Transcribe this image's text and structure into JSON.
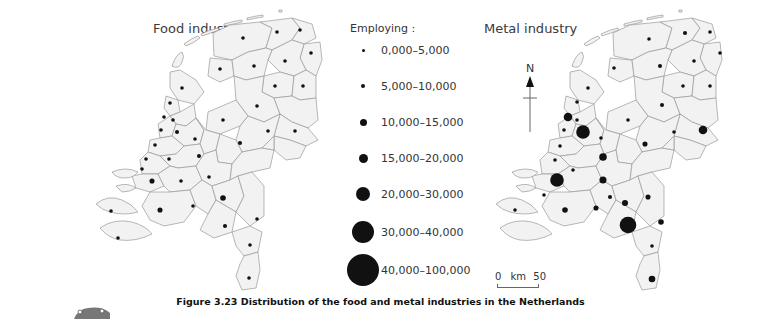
{
  "titles": {
    "food": "Food industry",
    "metal": "Metal industry"
  },
  "legend": {
    "title": "Employing :",
    "items": [
      {
        "label": "0,000–5,000",
        "size": 3
      },
      {
        "label": "5,000–10,000",
        "size": 4.5
      },
      {
        "label": "10,000–15,000",
        "size": 7
      },
      {
        "label": "15,000–20,000",
        "size": 9
      },
      {
        "label": "20,000–30,000",
        "size": 14
      },
      {
        "label": "30,000–40,000",
        "size": 22
      },
      {
        "label": "40,000–100,000",
        "size": 32
      }
    ]
  },
  "north_label": "N",
  "scale": {
    "start": "0",
    "unit": "km",
    "end": "50"
  },
  "caption": "Figure 3.23  Distribution of the food and metal industries in the Netherlands",
  "colors": {
    "land": "#f2f2f2",
    "border": "#9a9a9a",
    "symbol": "#111111"
  },
  "maps": {
    "food": {
      "dots": [
        [
          243,
          38,
          3
        ],
        [
          277,
          32,
          3
        ],
        [
          300,
          30,
          3
        ],
        [
          311,
          53,
          3
        ],
        [
          220,
          69,
          3
        ],
        [
          254,
          66,
          3
        ],
        [
          285,
          61,
          3
        ],
        [
          275,
          86,
          3
        ],
        [
          303,
          86,
          3
        ],
        [
          182,
          88,
          3
        ],
        [
          170,
          103,
          3
        ],
        [
          257,
          106,
          3
        ],
        [
          223,
          120,
          3
        ],
        [
          295,
          131,
          3
        ],
        [
          268,
          131,
          3
        ],
        [
          164,
          117,
          3
        ],
        [
          173,
          120,
          3
        ],
        [
          161,
          130,
          3
        ],
        [
          177,
          132,
          3.5
        ],
        [
          240,
          143,
          3.5
        ],
        [
          195,
          139,
          3
        ],
        [
          155,
          145,
          3
        ],
        [
          146,
          159,
          3
        ],
        [
          169,
          159,
          3
        ],
        [
          199,
          156,
          3.5
        ],
        [
          142,
          169,
          3
        ],
        [
          152,
          181,
          4.5
        ],
        [
          181,
          181,
          3
        ],
        [
          209,
          177,
          3
        ],
        [
          223,
          198,
          5
        ],
        [
          160,
          210,
          4.5
        ],
        [
          193,
          206,
          3
        ],
        [
          225,
          226,
          3.5
        ],
        [
          257,
          219,
          3
        ],
        [
          250,
          245,
          3
        ],
        [
          249,
          278,
          3
        ],
        [
          111,
          211,
          3
        ],
        [
          118,
          238,
          3
        ]
      ]
    },
    "metal": {
      "dots": [
        [
          649,
          39,
          3
        ],
        [
          685,
          33,
          3.5
        ],
        [
          710,
          32,
          3
        ],
        [
          720,
          53,
          3
        ],
        [
          614,
          68,
          3
        ],
        [
          660,
          66,
          3.5
        ],
        [
          694,
          61,
          3
        ],
        [
          683,
          86,
          3
        ],
        [
          710,
          86,
          3
        ],
        [
          588,
          88,
          3
        ],
        [
          577,
          102,
          3
        ],
        [
          662,
          105,
          3.5
        ],
        [
          628,
          120,
          3
        ],
        [
          703,
          130,
          8
        ],
        [
          674,
          132,
          3
        ],
        [
          568,
          117,
          8
        ],
        [
          577,
          120,
          3
        ],
        [
          564,
          130,
          3
        ],
        [
          583,
          132,
          13
        ],
        [
          645,
          144,
          4.5
        ],
        [
          601,
          138,
          3
        ],
        [
          560,
          146,
          3
        ],
        [
          603,
          157,
          7
        ],
        [
          555,
          160,
          3
        ],
        [
          573,
          170,
          3
        ],
        [
          603,
          180,
          6.5
        ],
        [
          557,
          180,
          13
        ],
        [
          544,
          195,
          3
        ],
        [
          610,
          197,
          3.5
        ],
        [
          648,
          197,
          4.5
        ],
        [
          625,
          203,
          5.5
        ],
        [
          565,
          210,
          5
        ],
        [
          596,
          208,
          4.5
        ],
        [
          628,
          225,
          16
        ],
        [
          661,
          222,
          5
        ],
        [
          652,
          246,
          3
        ],
        [
          652,
          279,
          6
        ],
        [
          515,
          210,
          3
        ]
      ]
    }
  }
}
